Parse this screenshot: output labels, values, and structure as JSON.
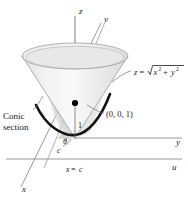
{
  "figure": {
    "axes": [
      {
        "name": "z-axis",
        "label": "z"
      },
      {
        "name": "v-axis",
        "label": "v"
      },
      {
        "name": "y-axis",
        "label": "y"
      },
      {
        "name": "u-axis",
        "label": "u"
      },
      {
        "name": "x-axis",
        "label": "x"
      }
    ],
    "equation": {
      "lhs": "z",
      "equals": "=",
      "radicand_x": "x",
      "radicand_x_sup": "2",
      "plus": "+",
      "radicand_y": "y",
      "radicand_y_sup": "2"
    },
    "point_label": "(0, 0, 1)",
    "conic_caption_line1": "Conic",
    "conic_caption_line2": "section",
    "height_label": "1",
    "distance_label": "c",
    "angle_label": "θ",
    "plane_label_lhs": "x",
    "plane_label_eq": "=",
    "plane_label_rhs": "c"
  },
  "colors": {
    "cone_fill": "#ededed",
    "cone_fill_light": "#f6f6f6",
    "cone_shadow": "#d8d8d8",
    "cone_stroke": "#9a9a9a",
    "axis_stroke": "#8c8c8c",
    "curve_stroke": "#111111",
    "point_fill": "#000000",
    "text": "#1a1a1a",
    "background": "#ffffff"
  }
}
